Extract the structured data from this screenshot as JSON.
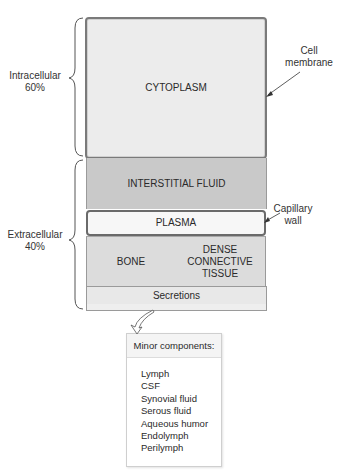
{
  "diagram": {
    "compartments": {
      "cytoplasm": "CYTOPLASM",
      "interstitial_fluid": "INTERSTITIAL FLUID",
      "plasma": "PLASMA",
      "bone": "BONE",
      "dense_connective_tissue": [
        "DENSE",
        "CONNECTIVE",
        "TISSUE"
      ],
      "secretions": "Secretions"
    },
    "braces": {
      "intracellular": {
        "label": "Intracellular",
        "percent": "60%"
      },
      "extracellular": {
        "label": "Extracellular",
        "percent": "40%"
      }
    },
    "callouts": {
      "cell_membrane": [
        "Cell",
        "membrane"
      ],
      "capillary_wall": [
        "Capillary",
        "wall"
      ]
    },
    "minor_components": {
      "title": "Minor components:",
      "items": [
        "Lymph",
        "CSF",
        "Synovial fluid",
        "Serous fluid",
        "Aqueous humor",
        "Endolymph",
        "Perilymph"
      ]
    }
  }
}
